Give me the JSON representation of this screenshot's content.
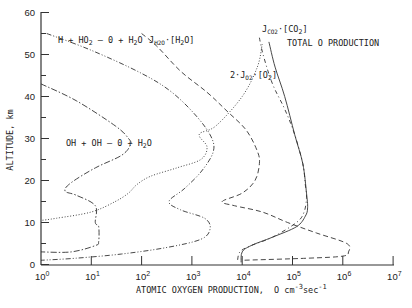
{
  "chart_data": {
    "type": "line",
    "title": "",
    "xlabel": "ATOMIC OXYGEN PRODUCTION, O cm-3 sec-1",
    "ylabel": "ALTITUDE, km",
    "xscale": "log",
    "xlim": [
      1,
      10000000
    ],
    "ylim": [
      0,
      60
    ],
    "x_ticks": [
      "10^0",
      "10^1",
      "10^2",
      "10^3",
      "10^4",
      "10^5",
      "10^6",
      "10^7"
    ],
    "y_ticks": [
      0,
      10,
      20,
      30,
      40,
      50,
      60
    ],
    "grid": false,
    "series": [
      {
        "name": "H + HO2 -> O + H2O",
        "style": "dash-dot-dot",
        "points": [
          [
            1.3,
            55
          ],
          [
            10,
            51
          ],
          [
            100,
            45.5
          ],
          [
            400,
            41
          ],
          [
            1300,
            35
          ],
          [
            2500,
            30
          ],
          [
            2600,
            26.5
          ],
          [
            1500,
            22
          ],
          [
            700,
            18
          ],
          [
            350,
            15
          ],
          [
            600,
            13
          ],
          [
            1800,
            11
          ],
          [
            2300,
            8.5
          ],
          [
            1500,
            6
          ],
          [
            300,
            4
          ],
          [
            40,
            2.5
          ],
          [
            5,
            1.5
          ],
          [
            1,
            1
          ]
        ]
      },
      {
        "name": "OH + OH -> O + H2O",
        "style": "dash-dot",
        "points": [
          [
            1,
            43
          ],
          [
            5,
            39
          ],
          [
            30,
            33
          ],
          [
            55,
            30
          ],
          [
            60,
            28.5
          ],
          [
            40,
            26
          ],
          [
            12,
            23
          ],
          [
            4,
            19.5
          ],
          [
            3,
            17.5
          ],
          [
            5,
            16.5
          ],
          [
            12,
            14
          ],
          [
            12,
            10
          ],
          [
            14,
            9
          ],
          [
            14,
            5.5
          ],
          [
            12,
            4.5
          ],
          [
            4,
            3
          ],
          [
            1,
            3
          ]
        ]
      },
      {
        "name": "J_H2O [H2O]",
        "style": "dash",
        "points": [
          [
            100,
            55
          ],
          [
            200,
            52
          ],
          [
            600,
            46
          ],
          [
            2000,
            41
          ],
          [
            5000,
            36.5
          ],
          [
            12000,
            32
          ],
          [
            20000,
            27
          ],
          [
            22000,
            24
          ],
          [
            18000,
            20
          ],
          [
            10000,
            17
          ],
          [
            4000,
            15
          ],
          [
            7000,
            14
          ],
          [
            25000,
            12.5
          ],
          [
            80000,
            10
          ],
          [
            300000,
            7.5
          ],
          [
            1200000,
            5
          ],
          [
            1300000,
            3
          ],
          [
            1000000,
            2
          ],
          [
            200000,
            1.5
          ],
          [
            10000,
            1
          ]
        ]
      },
      {
        "name": "2 J_O2 [O2]",
        "style": "dotted",
        "points": [
          [
            25000,
            52.5
          ],
          [
            20000,
            47
          ],
          [
            10000,
            40
          ],
          [
            3000,
            33
          ],
          [
            1400,
            31
          ],
          [
            2000,
            28
          ],
          [
            1500,
            25
          ],
          [
            500,
            23
          ],
          [
            150,
            21
          ],
          [
            80,
            19
          ],
          [
            55,
            17
          ],
          [
            30,
            15
          ],
          [
            10,
            12.5
          ],
          [
            2,
            11
          ],
          [
            1,
            10.5
          ]
        ]
      },
      {
        "name": "J_CO2 [CO2]",
        "style": "dash-dot-sparse",
        "points": [
          [
            22000,
            54
          ],
          [
            26000,
            50
          ],
          [
            40000,
            43
          ],
          [
            70000,
            37
          ],
          [
            110000,
            31
          ],
          [
            160000,
            24
          ],
          [
            180000,
            19
          ],
          [
            190000,
            16
          ],
          [
            170000,
            12.5
          ],
          [
            120000,
            10
          ],
          [
            40000,
            6.5
          ],
          [
            15000,
            4.5
          ],
          [
            9000,
            3
          ],
          [
            8000,
            0.5
          ]
        ]
      },
      {
        "name": "TOTAL O PRODUCTION",
        "style": "solid",
        "points": [
          [
            34000,
            53
          ],
          [
            45000,
            47
          ],
          [
            70000,
            40
          ],
          [
            110000,
            31
          ],
          [
            160000,
            24
          ],
          [
            190000,
            17
          ],
          [
            200000,
            13.5
          ],
          [
            180000,
            11.5
          ],
          [
            120000,
            9
          ],
          [
            40000,
            6.5
          ],
          [
            15000,
            4.5
          ],
          [
            10000,
            3
          ],
          [
            9500,
            0.5
          ]
        ]
      }
    ],
    "annotations": [
      {
        "text": "H + HO2 — O + H2O",
        "x": 1.6,
        "y": 55
      },
      {
        "text": "J_H2O·[H2O]",
        "x": 200,
        "y": 55
      },
      {
        "text": "J_CO2·[CO2]",
        "x": 22000,
        "y": 57
      },
      {
        "text": "TOTAL O PRODUCTION",
        "x": 45000,
        "y": 53.5
      },
      {
        "text": "2·J_O2·[O2]",
        "x": 8000,
        "y": 46
      },
      {
        "text": "OH + OH — O + H2O",
        "x": 4,
        "y": 29.5
      }
    ]
  },
  "axes": {
    "ylabel": "ALTITUDE, km",
    "xlabel_main": "ATOMIC OXYGEN PRODUCTION,",
    "xlabel_unit": "O cm",
    "xlabel_exp1": "-3",
    "xlabel_unit2": "sec",
    "xlabel_exp2": "-1",
    "y_tick_labels": [
      "0",
      "10",
      "20",
      "30",
      "40",
      "50",
      "60"
    ],
    "x_tick_bases": [
      "10",
      "10",
      "10",
      "10",
      "10",
      "10",
      "10",
      "10"
    ],
    "x_tick_exps": [
      "0",
      "1",
      "2",
      "3",
      "4",
      "5",
      "6",
      "7"
    ]
  },
  "labels": {
    "h_ho2": {
      "a": "H + HO",
      "s1": "2",
      "b": " — 0 + H",
      "s2": "2",
      "c": "O"
    },
    "oh_oh": {
      "a": "OH + OH — 0 + H",
      "s1": "2",
      "b": "O"
    },
    "jh2o": {
      "a": "J",
      "s1": "H2O",
      "b": "·[H",
      "s2": "2",
      "c": "O]"
    },
    "jco2": {
      "a": "J",
      "s1": "CO2",
      "b": "·[CO",
      "s2": "2",
      "c": "]"
    },
    "jo2": {
      "a": "2·J",
      "s1": "O2",
      "b": "·[O",
      "s2": "2",
      "c": "]"
    },
    "total": "TOTAL O PRODUCTION"
  }
}
